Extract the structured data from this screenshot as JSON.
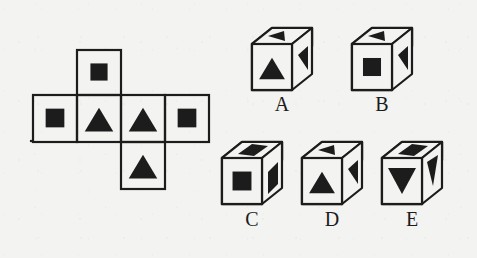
{
  "figure": {
    "type": "spatial-reasoning-cube-folding-puzzle",
    "background_color": "#f3f3f1",
    "ink_color": "#1c1c1c",
    "net": {
      "name": "cube-net",
      "description": "Cross-shaped unfolded cube net with six square cells",
      "cells": [
        {
          "id": "net-cell-top",
          "row": 0,
          "col": 1,
          "symbol": "square",
          "symbol_name": "filled-square"
        },
        {
          "id": "net-cell-left",
          "row": 1,
          "col": 0,
          "symbol": "square",
          "symbol_name": "filled-square"
        },
        {
          "id": "net-cell-center-left",
          "row": 1,
          "col": 1,
          "symbol": "triangle",
          "symbol_name": "filled-triangle-up"
        },
        {
          "id": "net-cell-center-right",
          "row": 1,
          "col": 2,
          "symbol": "triangle",
          "symbol_name": "filled-triangle-up"
        },
        {
          "id": "net-cell-right",
          "row": 1,
          "col": 3,
          "symbol": "square",
          "symbol_name": "filled-square"
        },
        {
          "id": "net-cell-bottom",
          "row": 2,
          "col": 2,
          "symbol": "triangle",
          "symbol_name": "filled-triangle-up"
        }
      ]
    },
    "options": [
      {
        "id": "option-a",
        "label": "A",
        "faces": {
          "top": {
            "symbol": "triangle",
            "symbol_name": "filled-triangle-left"
          },
          "front": {
            "symbol": "triangle",
            "symbol_name": "filled-triangle-up"
          },
          "right": {
            "symbol": "triangle",
            "symbol_name": "filled-triangle-right"
          }
        }
      },
      {
        "id": "option-b",
        "label": "B",
        "faces": {
          "top": {
            "symbol": "triangle",
            "symbol_name": "filled-triangle-left"
          },
          "front": {
            "symbol": "square",
            "symbol_name": "filled-square"
          },
          "right": {
            "symbol": "triangle",
            "symbol_name": "filled-triangle-right"
          }
        }
      },
      {
        "id": "option-c",
        "label": "C",
        "faces": {
          "top": {
            "symbol": "square",
            "symbol_name": "filled-square"
          },
          "front": {
            "symbol": "square",
            "symbol_name": "filled-square"
          },
          "right": {
            "symbol": "square",
            "symbol_name": "filled-square"
          }
        }
      },
      {
        "id": "option-d",
        "label": "D",
        "faces": {
          "top": {
            "symbol": "triangle",
            "symbol_name": "filled-triangle-left"
          },
          "front": {
            "symbol": "triangle",
            "symbol_name": "filled-triangle-up"
          },
          "right": {
            "symbol": "triangle",
            "symbol_name": "filled-triangle-right"
          }
        }
      },
      {
        "id": "option-e",
        "label": "E",
        "faces": {
          "top": {
            "symbol": "square",
            "symbol_name": "filled-square"
          },
          "front": {
            "symbol": "triangle",
            "symbol_name": "filled-triangle-down"
          },
          "right": {
            "symbol": "triangle",
            "symbol_name": "filled-triangle-down"
          }
        }
      }
    ]
  }
}
